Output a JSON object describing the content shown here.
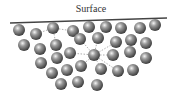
{
  "title": "Surface",
  "colors": {
    "line": "#444444",
    "dash": "#9a9a9a",
    "molecule_dark": "#3a3a3a",
    "molecule_mid": "#8a8a8a",
    "molecule_light": "#f4f4f4"
  },
  "surface_line": {
    "x1": 10,
    "y1": 23,
    "x2": 167,
    "y2": 18
  },
  "molecule_radius": 6,
  "molecules": [
    {
      "x": 19,
      "y": 30
    },
    {
      "x": 36,
      "y": 34
    },
    {
      "x": 53,
      "y": 28
    },
    {
      "x": 73,
      "y": 31
    },
    {
      "x": 89,
      "y": 27
    },
    {
      "x": 106,
      "y": 27
    },
    {
      "x": 121,
      "y": 28
    },
    {
      "x": 140,
      "y": 28
    },
    {
      "x": 155,
      "y": 25
    },
    {
      "x": 24,
      "y": 45
    },
    {
      "x": 40,
      "y": 49
    },
    {
      "x": 56,
      "y": 45
    },
    {
      "x": 80,
      "y": 39
    },
    {
      "x": 98,
      "y": 38
    },
    {
      "x": 116,
      "y": 42
    },
    {
      "x": 131,
      "y": 40
    },
    {
      "x": 146,
      "y": 43
    },
    {
      "x": 41,
      "y": 63
    },
    {
      "x": 57,
      "y": 58
    },
    {
      "x": 70,
      "y": 53
    },
    {
      "x": 94,
      "y": 55
    },
    {
      "x": 113,
      "y": 55
    },
    {
      "x": 130,
      "y": 52
    },
    {
      "x": 146,
      "y": 58
    },
    {
      "x": 52,
      "y": 73
    },
    {
      "x": 67,
      "y": 70
    },
    {
      "x": 81,
      "y": 66
    },
    {
      "x": 101,
      "y": 69
    },
    {
      "x": 118,
      "y": 71
    },
    {
      "x": 133,
      "y": 70
    },
    {
      "x": 61,
      "y": 84
    },
    {
      "x": 78,
      "y": 82
    },
    {
      "x": 97,
      "y": 85
    }
  ],
  "surface_center": {
    "x": 53,
    "y": 28
  },
  "surface_links": [
    {
      "x": 36,
      "y": 34
    },
    {
      "x": 73,
      "y": 31
    },
    {
      "x": 56,
      "y": 45
    }
  ],
  "bulk_center": {
    "x": 94,
    "y": 55
  },
  "bulk_links": [
    {
      "x": 80,
      "y": 39
    },
    {
      "x": 98,
      "y": 38
    },
    {
      "x": 116,
      "y": 42
    },
    {
      "x": 70,
      "y": 53
    },
    {
      "x": 113,
      "y": 55
    },
    {
      "x": 81,
      "y": 66
    },
    {
      "x": 101,
      "y": 69
    },
    {
      "x": 118,
      "y": 71
    }
  ]
}
